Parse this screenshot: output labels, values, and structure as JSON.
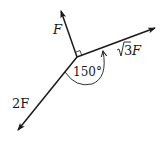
{
  "diagram": {
    "type": "force-vectors",
    "origin": {
      "x": 77,
      "y": 57
    },
    "vectors": [
      {
        "id": "f",
        "label": "F",
        "tip": {
          "x": 61,
          "y": 10
        }
      },
      {
        "id": "sqrt3f",
        "label_radical": "3",
        "label_suffix": " F",
        "tip": {
          "x": 156,
          "y": 28
        }
      },
      {
        "id": "twof",
        "label": "2F",
        "tip": {
          "x": 17,
          "y": 131
        }
      }
    ],
    "angle_label": "150°",
    "right_angle_marker": true,
    "color": "#1a1a1a"
  }
}
